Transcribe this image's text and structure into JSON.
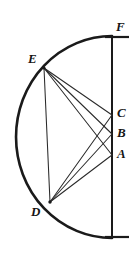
{
  "figure": {
    "width": 139,
    "height": 253,
    "background_color": "#ffffff",
    "ink_color": "#1a1a1a",
    "chord_color": "#2a2a2a"
  },
  "labels": {
    "F": "F",
    "E": "E",
    "C": "C",
    "B": "B",
    "A": "A",
    "D": "D"
  },
  "geometry": {
    "type": "diagram",
    "axis_line": {
      "name": "vertical-diameter",
      "x": 112,
      "y_top": 36,
      "y_bottom": 238
    },
    "arc": {
      "name": "semicircular-arc",
      "center_x": 112,
      "center_y": 137,
      "radius_x": 96,
      "radius_y": 101,
      "start": [
        112,
        36
      ],
      "end": [
        112,
        238
      ],
      "sweep": "left"
    },
    "points": [
      {
        "id": "F",
        "x": 112,
        "y": 36,
        "label_dx": 6,
        "label_dy": -14,
        "on": "axis-top"
      },
      {
        "id": "E",
        "x": 44,
        "y": 68,
        "label_dx": -14,
        "label_dy": -14,
        "on": "arc"
      },
      {
        "id": "C",
        "x": 112,
        "y": 115,
        "label_dx": 6,
        "label_dy": -7,
        "on": "axis"
      },
      {
        "id": "B",
        "x": 112,
        "y": 134,
        "label_dx": 6,
        "label_dy": -7,
        "on": "axis"
      },
      {
        "id": "A",
        "x": 112,
        "y": 155,
        "label_dx": 6,
        "label_dy": -7,
        "on": "axis"
      },
      {
        "id": "D",
        "x": 50,
        "y": 202,
        "label_dx": -16,
        "label_dy": 6,
        "on": "arc"
      }
    ],
    "chords": [
      {
        "name": "chord-E-C",
        "from": "E",
        "to": "C",
        "x1": 44,
        "y1": 68,
        "x2": 112,
        "y2": 115
      },
      {
        "name": "chord-E-B",
        "from": "E",
        "to": "B",
        "x1": 44,
        "y1": 68,
        "x2": 112,
        "y2": 134
      },
      {
        "name": "chord-E-A",
        "from": "E",
        "to": "A",
        "x1": 44,
        "y1": 68,
        "x2": 112,
        "y2": 155
      },
      {
        "name": "chord-E-D",
        "from": "E",
        "to": "D",
        "x1": 44,
        "y1": 68,
        "x2": 50,
        "y2": 202
      },
      {
        "name": "chord-D-C",
        "from": "D",
        "to": "C",
        "x1": 50,
        "y1": 202,
        "x2": 112,
        "y2": 115
      },
      {
        "name": "chord-D-B",
        "from": "D",
        "to": "B",
        "x1": 50,
        "y1": 202,
        "x2": 112,
        "y2": 134
      },
      {
        "name": "chord-D-A",
        "from": "D",
        "to": "A",
        "x1": 50,
        "y1": 202,
        "x2": 112,
        "y2": 155
      }
    ],
    "end_caps": [
      {
        "name": "top-cap",
        "x1": 106,
        "y1": 37,
        "x2": 128,
        "y2": 37
      },
      {
        "name": "bottom-cap",
        "x1": 106,
        "y1": 237,
        "x2": 128,
        "y2": 237
      }
    ]
  }
}
